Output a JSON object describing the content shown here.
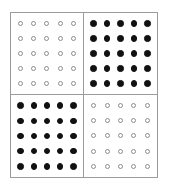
{
  "figure": {
    "type": "dot-matrix-checkerboard",
    "rows": 2,
    "columns": 2,
    "cell_rows": 5,
    "cell_columns": 5,
    "marker_open_name": "open-circle-marker",
    "marker_filled_name": "filled-circle-marker",
    "colors": {
      "background": "#ffffff",
      "border": "#9b9b9b",
      "divider": "#9b9b9b",
      "open_marker_stroke": "#8d8d8d",
      "open_marker_fill": "#ffffff",
      "filled_marker_fill": "#111111"
    },
    "quadrants": [
      {
        "id": "top-left",
        "fill_state": "open",
        "markers": [
          [
            "open",
            "open",
            "open",
            "open",
            "open"
          ],
          [
            "open",
            "open",
            "open",
            "open",
            "open"
          ],
          [
            "open",
            "open",
            "open",
            "open",
            "open"
          ],
          [
            "open",
            "open",
            "open",
            "open",
            "open"
          ],
          [
            "open",
            "open",
            "open",
            "open",
            "open"
          ]
        ]
      },
      {
        "id": "top-right",
        "fill_state": "filled",
        "markers": [
          [
            "filled",
            "filled",
            "filled",
            "filled",
            "filled"
          ],
          [
            "filled",
            "filled",
            "filled",
            "filled",
            "filled"
          ],
          [
            "filled",
            "filled",
            "filled",
            "filled",
            "filled"
          ],
          [
            "filled",
            "filled",
            "filled",
            "filled",
            "filled"
          ],
          [
            "filled",
            "filled",
            "filled",
            "filled",
            "filled"
          ]
        ]
      },
      {
        "id": "bottom-left",
        "fill_state": "filled",
        "markers": [
          [
            "filled",
            "filled",
            "filled",
            "filled",
            "filled"
          ],
          [
            "filled",
            "filled",
            "filled",
            "filled",
            "filled"
          ],
          [
            "filled",
            "filled",
            "filled",
            "filled",
            "filled"
          ],
          [
            "filled",
            "filled",
            "filled",
            "filled",
            "filled"
          ],
          [
            "filled",
            "filled",
            "filled",
            "filled",
            "filled"
          ]
        ]
      },
      {
        "id": "bottom-right",
        "fill_state": "open",
        "markers": [
          [
            "open",
            "open",
            "open",
            "open",
            "open"
          ],
          [
            "open",
            "open",
            "open",
            "open",
            "open"
          ],
          [
            "open",
            "open",
            "open",
            "open",
            "open"
          ],
          [
            "open",
            "open",
            "open",
            "open",
            "open"
          ],
          [
            "open",
            "open",
            "open",
            "open",
            "open"
          ]
        ]
      }
    ]
  }
}
